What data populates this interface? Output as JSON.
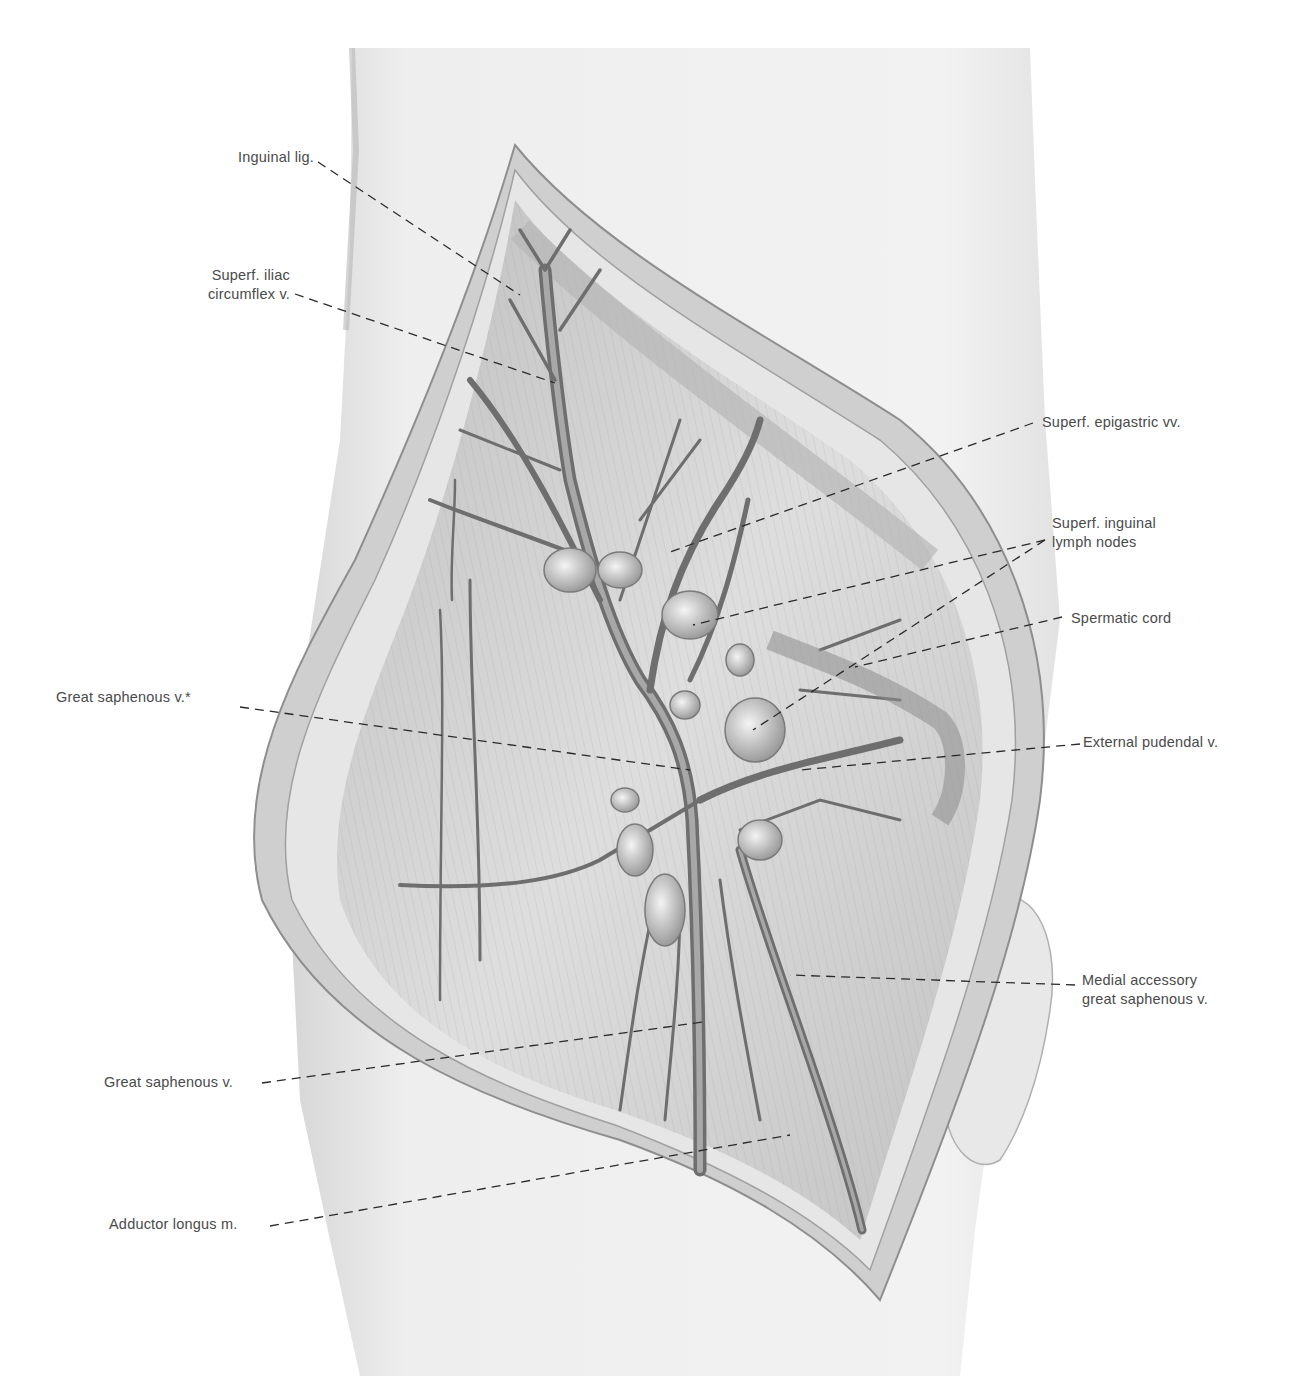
{
  "figure": {
    "palette": {
      "background": "#ffffff",
      "skin": "#ebebeb",
      "skin_shadow": "#c8c8c8",
      "incision_edge": "#9a9a9a",
      "muscle": "#d4d4d4",
      "vein": "#7a7a7a",
      "node": "#bdbdbd",
      "label_text": "#4a4a4a",
      "leader_line": "#2a2a2a"
    }
  },
  "labels": {
    "inguinal_lig": "Inguinal lig.",
    "superf_iliac_circumflex_1": "Superf. iliac",
    "superf_iliac_circumflex_2": "circumflex v.",
    "superf_epigastric": "Superf. epigastric vv.",
    "superf_inguinal_nodes_1": "Superf. inguinal",
    "superf_inguinal_nodes_2": "lymph nodes",
    "spermatic_cord": "Spermatic cord",
    "great_saphenous_star": "Great saphenous v.*",
    "external_pudendal": "External pudendal v.",
    "medial_accessory_1": "Medial accessory",
    "medial_accessory_2": "great saphenous v.",
    "great_saphenous": "Great saphenous v.",
    "adductor_longus": "Adductor longus m."
  }
}
